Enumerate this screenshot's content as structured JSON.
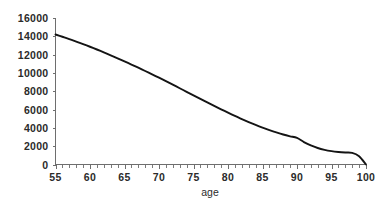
{
  "chart_data": {
    "type": "line",
    "title": "",
    "subtitle": "",
    "xlabel": "age",
    "ylabel": "",
    "xlim": [
      55,
      100
    ],
    "ylim": [
      0,
      16000
    ],
    "grid": false,
    "legend": null,
    "legend_position": "none",
    "x_tick_labels": [
      "55",
      "60",
      "65",
      "70",
      "75",
      "80",
      "85",
      "90",
      "95",
      "100"
    ],
    "x_tick_values": [
      55,
      60,
      65,
      70,
      75,
      80,
      85,
      90,
      95,
      100
    ],
    "x_minor_tick_step": 1,
    "y_tick_labels": [
      "0",
      "2000",
      "4000",
      "6000",
      "8000",
      "10000",
      "12000",
      "14000",
      "16000"
    ],
    "y_tick_values": [
      0,
      2000,
      4000,
      6000,
      8000,
      10000,
      12000,
      14000,
      16000
    ],
    "series": [
      {
        "name": "survivors",
        "color": "#141414",
        "x": [
          55,
          56,
          57,
          58,
          59,
          60,
          61,
          62,
          63,
          64,
          65,
          66,
          67,
          68,
          69,
          70,
          71,
          72,
          73,
          74,
          75,
          76,
          77,
          78,
          79,
          80,
          81,
          82,
          83,
          84,
          85,
          86,
          87,
          88,
          89,
          90,
          91,
          92,
          93,
          94,
          95,
          96,
          97,
          98,
          99,
          100
        ],
        "values": [
          14200,
          13950,
          13700,
          13430,
          13150,
          12860,
          12560,
          12250,
          11930,
          11600,
          11260,
          10920,
          10570,
          10210,
          9850,
          9480,
          9100,
          8720,
          8330,
          7940,
          7550,
          7160,
          6780,
          6400,
          6030,
          5660,
          5300,
          4960,
          4630,
          4320,
          4030,
          3760,
          3510,
          3280,
          3080,
          2900,
          2450,
          2080,
          1800,
          1600,
          1460,
          1370,
          1310,
          1270,
          900,
          0
        ]
      }
    ]
  },
  "axis_titles": {
    "x": "age"
  }
}
